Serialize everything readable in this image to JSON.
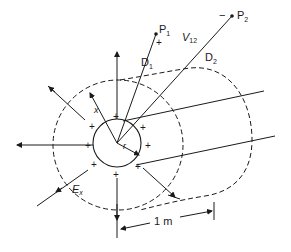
{
  "diagram": {
    "title": "",
    "points": [
      {
        "id": "p1",
        "label": "P",
        "subscript": "1",
        "polarity": "+"
      },
      {
        "id": "p2",
        "label": "P",
        "subscript": "2",
        "polarity": "−"
      }
    ],
    "voltage_label": {
      "main": "V",
      "subscript": "12"
    },
    "distances": [
      {
        "label": "D",
        "subscript": "1"
      },
      {
        "label": "D",
        "subscript": "2"
      }
    ],
    "radius_label": "r",
    "distance_x_label": "x",
    "field_label": {
      "main": "E",
      "subscript": "x"
    },
    "length_label": "1 m",
    "charge_symbol": "+",
    "colors": {
      "ink": "#1a1a1a",
      "background": "#ffffff"
    }
  }
}
